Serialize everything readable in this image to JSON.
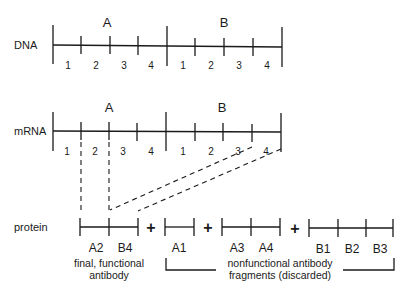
{
  "rows": {
    "dna": "DNA",
    "mrna": "mRNA",
    "protein": "protein"
  },
  "genes": {
    "a": "A",
    "b": "B"
  },
  "exons": {
    "dna": [
      "1",
      "2",
      "3",
      "4",
      "1",
      "2",
      "3",
      "4"
    ],
    "mrna": [
      "1",
      "2",
      "3",
      "4",
      "1",
      "2",
      "3",
      "4"
    ]
  },
  "protein_segments": {
    "final": [
      "A2",
      "B4"
    ],
    "frag1": [
      "A1"
    ],
    "frag2": [
      "A3",
      "A4"
    ],
    "frag3": [
      "B1",
      "B2",
      "B3"
    ]
  },
  "operators": {
    "plus": "+"
  },
  "captions": {
    "final_line1": "final, functional",
    "final_line2": "antibody",
    "discard_line1": "nonfunctional antibody",
    "discard_line2": "fragments (discarded)"
  }
}
